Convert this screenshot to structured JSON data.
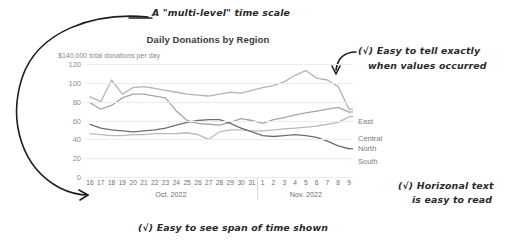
{
  "chart_data": {
    "type": "line",
    "title": "Daily Donations by Region",
    "subtitle": "$140,000 total donations per day",
    "xlabel": "",
    "ylabel": "",
    "ylim": [
      0,
      120
    ],
    "yticks": [
      0,
      20,
      40,
      60,
      80,
      100,
      120
    ],
    "grid": true,
    "legend_position": "right-inline-labels",
    "x": [
      "16",
      "17",
      "18",
      "19",
      "20",
      "21",
      "22",
      "23",
      "24",
      "25",
      "26",
      "27",
      "28",
      "29",
      "30",
      "31",
      "1",
      "2",
      "3",
      "4",
      "5",
      "6",
      "7",
      "8",
      "9"
    ],
    "x_groups": [
      {
        "label": "Oct. 2022",
        "start": "16",
        "end": "31"
      },
      {
        "label": "Nov. 2022",
        "start": "1",
        "end": "9"
      }
    ],
    "series": [
      {
        "name": "East",
        "color": "#b4b4b4",
        "values": [
          85,
          80,
          103,
          88,
          95,
          96,
          94,
          92,
          90,
          88,
          87,
          86,
          88,
          90,
          89,
          92,
          95,
          97,
          101,
          108,
          113,
          105,
          103,
          96,
          72
        ]
      },
      {
        "name": "Central",
        "color": "#a6a6a6",
        "values": [
          79,
          72,
          76,
          84,
          88,
          88,
          86,
          84,
          70,
          60,
          57,
          56,
          55,
          58,
          62,
          60,
          57,
          61,
          63,
          66,
          68,
          70,
          72,
          74,
          69
        ]
      },
      {
        "name": "North",
        "color": "#b9b9b9",
        "values": [
          46,
          45,
          44,
          44,
          45,
          45,
          46,
          46,
          46,
          47,
          45,
          40,
          48,
          50,
          50,
          49,
          49,
          50,
          51,
          52,
          53,
          54,
          56,
          58,
          64
        ]
      },
      {
        "name": "South",
        "color": "#6f6f6f",
        "values": [
          56,
          52,
          50,
          49,
          48,
          49,
          50,
          52,
          55,
          58,
          60,
          61,
          61,
          57,
          52,
          48,
          44,
          43,
          44,
          45,
          44,
          42,
          38,
          33,
          30
        ]
      }
    ]
  },
  "yticks_display": [
    "120",
    "100",
    "80",
    "60",
    "40",
    "20",
    "0"
  ],
  "series_labels": [
    {
      "name": "East"
    },
    {
      "name": "Central"
    },
    {
      "name": "North"
    },
    {
      "name": "South"
    }
  ],
  "annotations": {
    "top": "A \"multi-level\" time scale",
    "right_line1": "(√) Easy to tell exactly",
    "right_line2": "when values occurred",
    "right_line3": "(√) Horizonal text",
    "right_line4": "is easy to read",
    "bottom": "(√) Easy to see span of time shown"
  },
  "colors": {
    "grid": "#ececec",
    "axis": "#c9c9c9",
    "title_text": "#3c3c3c",
    "subtitle_text": "#8a8a8a",
    "tick_text": "#6e6e6e",
    "ink": "#1e1e1e"
  }
}
